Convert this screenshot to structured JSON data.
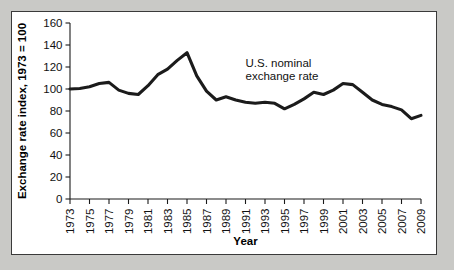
{
  "figure": {
    "background_color": "#c9c9c6",
    "card_color": "#ffffff",
    "border_color": "#3a3a3a"
  },
  "chart_data": {
    "type": "line",
    "title": "",
    "xlabel": "Year",
    "ylabel": "Exchange rate index, 1973 = 100",
    "xlim": [
      1973,
      2009
    ],
    "ylim": [
      0,
      160
    ],
    "grid": false,
    "legend_position": "none",
    "line_color": "#1b1b1b",
    "annotations": [
      {
        "name": "series-annotation",
        "lines": [
          "U.S. nominal",
          "exchange rate"
        ],
        "x": 1991,
        "y": 120
      }
    ],
    "ytick_values": [
      0,
      20,
      40,
      60,
      80,
      100,
      120,
      140,
      160
    ],
    "ytick_labels": [
      "0",
      "20",
      "40",
      "60",
      "80",
      "100",
      "120",
      "140",
      "160"
    ],
    "xtick_values": [
      1973,
      1975,
      1977,
      1979,
      1981,
      1983,
      1985,
      1987,
      1989,
      1991,
      1993,
      1995,
      1997,
      1999,
      2001,
      2003,
      2005,
      2007,
      2009
    ],
    "xtick_labels": [
      "1973",
      "1975",
      "1977",
      "1979",
      "1981",
      "1983",
      "1985",
      "1987",
      "1989",
      "1991",
      "1993",
      "1995",
      "1997",
      "1999",
      "2001",
      "2003",
      "2005",
      "2007",
      "2009"
    ],
    "series": [
      {
        "name": "U.S. nominal exchange rate",
        "x": [
          1973,
          1974,
          1975,
          1976,
          1977,
          1978,
          1979,
          1980,
          1981,
          1982,
          1983,
          1984,
          1985,
          1986,
          1987,
          1988,
          1989,
          1990,
          1991,
          1992,
          1993,
          1994,
          1995,
          1996,
          1997,
          1998,
          1999,
          2000,
          2001,
          2002,
          2003,
          2004,
          2005,
          2006,
          2007,
          2008,
          2009
        ],
        "values": [
          100,
          100.5,
          102,
          105,
          106,
          99,
          96,
          95,
          103,
          113,
          118,
          126,
          133,
          112,
          98,
          90,
          93,
          90,
          88,
          87,
          88,
          87,
          82,
          86,
          91,
          97,
          95,
          99,
          105,
          104,
          97,
          90,
          86,
          84,
          81,
          73,
          76
        ]
      }
    ]
  }
}
